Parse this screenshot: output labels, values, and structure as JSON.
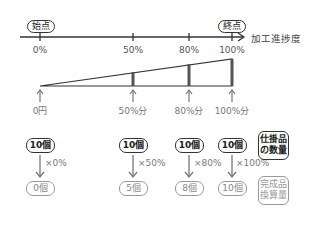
{
  "axis": {
    "start_label": "始点",
    "end_label": "終点",
    "axis_title": "加工進捗度",
    "ticks": [
      "0%",
      "50%",
      "80%",
      "100%"
    ]
  },
  "cost_arrows": [
    "0円",
    "50%分",
    "80%分",
    "100%分"
  ],
  "units": [
    {
      "wip": "10個",
      "multiplier": "×0%",
      "equivalent": "0個"
    },
    {
      "wip": "10個",
      "multiplier": "×50%",
      "equivalent": "5個"
    },
    {
      "wip": "10個",
      "multiplier": "×80%",
      "equivalent": "8個"
    },
    {
      "wip": "10個",
      "multiplier": "×100%",
      "equivalent": "10個"
    }
  ],
  "legend": {
    "wip_quantity": [
      "仕掛品",
      "の数量"
    ],
    "equivalent_units": [
      "完成品",
      "換算量"
    ]
  },
  "colors": {
    "line": "#333333",
    "muted": "#888888"
  }
}
